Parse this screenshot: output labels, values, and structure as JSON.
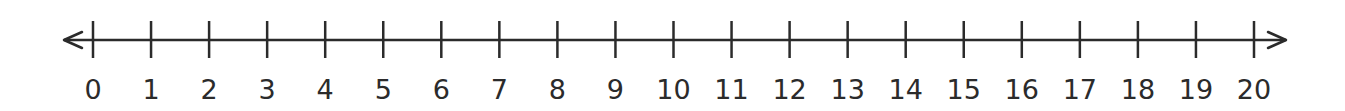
{
  "chart_data": {
    "type": "number_line",
    "min": 0,
    "max": 20,
    "step": 1,
    "tick_labels": [
      "0",
      "1",
      "2",
      "3",
      "4",
      "5",
      "6",
      "7",
      "8",
      "9",
      "10",
      "11",
      "12",
      "13",
      "14",
      "15",
      "16",
      "17",
      "18",
      "19",
      "20"
    ],
    "arrows": "both",
    "color": "#2b2b2b"
  }
}
